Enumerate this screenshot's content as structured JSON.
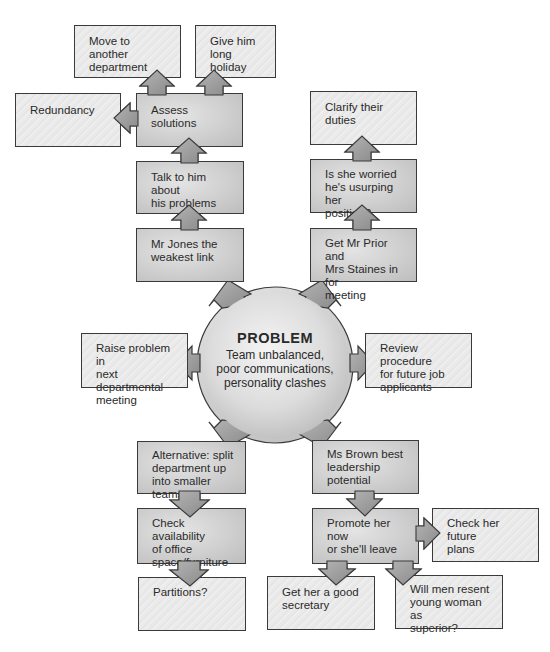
{
  "diagram": {
    "center": {
      "title": "PROBLEM",
      "description": "Team unbalanced,\npoor communications,\npersonality clashes"
    },
    "nodes": {
      "move_department": "Move to another\ndepartment",
      "long_holiday": "Give him long\nholiday",
      "redundancy": "Redundancy",
      "assess_solutions": "Assess solutions",
      "clarify_duties": "Clarify their duties",
      "talk_to_him": "Talk to him about\nhis problems",
      "is_she_worried": "Is she worried\nhe's usurping her\nposition?",
      "mr_jones": "Mr Jones the\nweakest link",
      "get_mr_prior": "Get Mr Prior and\nMrs Staines in for\nmeeting",
      "raise_problem": "Raise problem in\nnext departmental\nmeeting",
      "review_procedure": "Review procedure\nfor future job\napplicants",
      "alternative_split": "Alternative: split\ndepartment up\ninto smaller teams",
      "ms_brown": "Ms Brown best\nleadership\npotential",
      "check_availability": "Check availability\nof office\nspace/furniture",
      "promote_her": "Promote her now\nor she'll leave",
      "check_future_plans": "Check her future\nplans",
      "partitions": "Partitions?",
      "good_secretary": "Get her a good\nsecretary",
      "men_resent": "Will men resent\nyoung woman as\nsuperior?"
    },
    "colors": {
      "border": "#3a3a3a",
      "box_fill": "#e8e8e8",
      "arrow_fill": "#9a9a9a",
      "text": "#2a2a2a"
    }
  }
}
